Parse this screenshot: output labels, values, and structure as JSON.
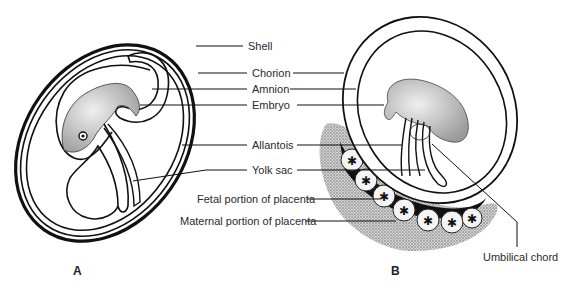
{
  "diagram": {
    "type": "anatomical-comparison",
    "panels": [
      {
        "id": "A",
        "label": "A",
        "description": "Amniote egg with shell"
      },
      {
        "id": "B",
        "label": "B",
        "description": "Placental mammal embryo"
      }
    ],
    "labels": {
      "shell": "Shell",
      "chorion": "Chorion",
      "amnion": "Amnion",
      "embryo": "Embryo",
      "allantois": "Allantois",
      "yolk_sac": "Yolk sac",
      "fetal_placenta": "Fetal portion of placenta",
      "maternal_placenta": "Maternal portion of placenta",
      "umbilical_chord": "Umbilical chord"
    },
    "colors": {
      "line": "#111111",
      "text": "#2a2a2a",
      "stipple": "#777777",
      "background": "#ffffff"
    }
  }
}
